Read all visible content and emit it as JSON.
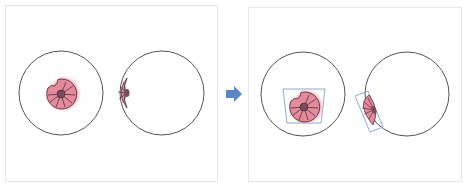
{
  "colors": {
    "background": "#ffffff",
    "panel_border": "#e6e6e6",
    "circle_stroke": "#555555",
    "shell_fill": "#e58a9a",
    "shell_glow": "#f2b3c0",
    "shell_stroke": "#3a2430",
    "shell_core": "#7a4a5c",
    "box_stroke": "#7fa3c8",
    "arrow_fill": "#5b87c5"
  },
  "panels": [
    {
      "name": "before",
      "x": 5,
      "y": 5,
      "width": 213,
      "height": 177,
      "circles": [
        {
          "cx": 61,
          "cy": 93,
          "r": 42
        },
        {
          "cx": 162,
          "cy": 93,
          "r": 42
        }
      ]
    },
    {
      "name": "after",
      "x": 248,
      "y": 7,
      "width": 214,
      "height": 175,
      "circles": [
        {
          "cx": 303,
          "cy": 94,
          "r": 42
        },
        {
          "cx": 407,
          "cy": 94,
          "r": 42
        }
      ]
    }
  ],
  "arrow": {
    "direction": "right",
    "x": 226,
    "y": 86,
    "width": 16,
    "height": 16
  },
  "shells": [
    {
      "id": "full-shell-before",
      "cx": 61,
      "cy": 94,
      "r": 16
    },
    {
      "id": "half-shell-before",
      "cx": 126,
      "cy": 93
    },
    {
      "id": "full-shell-after",
      "cx": 304,
      "cy": 107,
      "r": 15
    },
    {
      "id": "half-shell-after",
      "cx": 368,
      "cy": 109
    }
  ],
  "bounding_boxes": [
    {
      "id": "trapezoid-box",
      "points": "283,89 325,89 321,123 287,123"
    },
    {
      "id": "rotated-box",
      "points": "355,96 368,91 383,127 370,132"
    }
  ]
}
